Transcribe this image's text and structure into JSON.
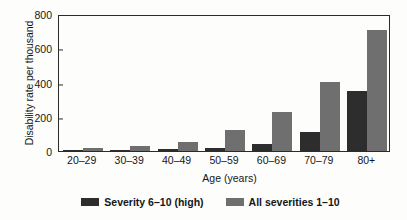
{
  "chart_data": {
    "type": "bar",
    "title": "",
    "subtitle": "",
    "xlabel": "Age (years)",
    "ylabel": "Disability rate per thousand",
    "categories": [
      "20–29",
      "30–39",
      "40–49",
      "50–59",
      "60–69",
      "70–79",
      "80+"
    ],
    "series": [
      {
        "name": "Severity 6–10 (high)",
        "color": "#2d2d2d",
        "values": [
          5,
          5,
          10,
          20,
          42,
          112,
          348
        ]
      },
      {
        "name": "All severities 1–10",
        "color": "#6f6f6f",
        "values": [
          20,
          30,
          55,
          125,
          230,
          402,
          705
        ]
      }
    ],
    "ylim": [
      0,
      800
    ],
    "yticks": [
      0,
      200,
      400,
      600,
      800
    ],
    "ytick_labels": [
      "0",
      "200",
      "400",
      "600",
      "800"
    ],
    "grid": false,
    "legend_position": "bottom",
    "frame": true,
    "bar_group_order": [
      "Severity 6–10 (high)",
      "All severities 1–10"
    ]
  },
  "legend": {
    "items": [
      {
        "label": "Severity 6–10 (high)",
        "color": "#2d2d2d"
      },
      {
        "label": "All severities 1–10",
        "color": "#6f6f6f"
      }
    ]
  }
}
